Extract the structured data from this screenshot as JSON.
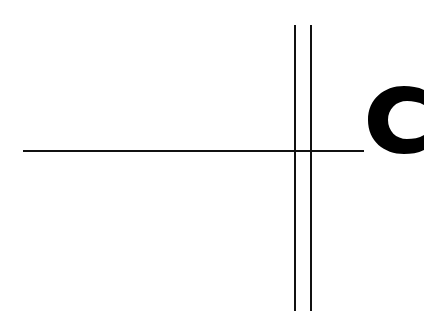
{
  "diagram": {
    "label": "C",
    "line_color": "#111111",
    "label_color": "#000000",
    "elements": [
      {
        "type": "horizontal-line",
        "x1": 23,
        "x2": 364,
        "y": 151
      },
      {
        "type": "vertical-line",
        "x": 295,
        "y1": 25,
        "y2": 311
      },
      {
        "type": "vertical-line",
        "x": 311,
        "y1": 25,
        "y2": 311
      },
      {
        "type": "text-label",
        "text": "C",
        "x": 367,
        "y": 88
      }
    ]
  }
}
